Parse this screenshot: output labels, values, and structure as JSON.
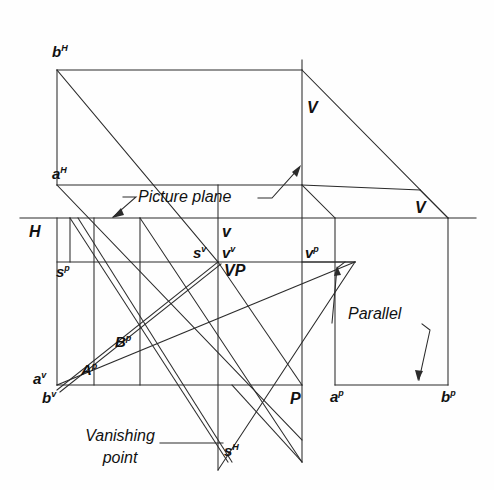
{
  "figure": {
    "type": "technical-drawing",
    "background_color": "#fefefe",
    "line_color": "#2b2b2b",
    "text_color": "#111111"
  },
  "labels": {
    "b_H": "b",
    "b_H_sup": "H",
    "a_H": "a",
    "a_H_sup": "H",
    "H": "H",
    "s_p": "s",
    "s_p_sup": "p",
    "v_small": "v",
    "s_v": "s",
    "s_v_sup": "v",
    "v_v": "v",
    "v_v_sup": "v",
    "VP": "VP",
    "v_p": "v",
    "v_p_sup": "p",
    "V_upper": "V",
    "V_right": "V",
    "V_mid": "V",
    "B_p": "B",
    "B_p_sup": "p",
    "A_p": "A",
    "A_p_sup": "p",
    "a_v": "a",
    "a_v_sup": "v",
    "b_v": "b",
    "b_v_sup": "v",
    "a_p": "a",
    "a_p_sup": "p",
    "b_p": "b",
    "b_p_sup": "p",
    "P": "P",
    "s_H": "s",
    "s_H_sup": "H"
  },
  "annotations": {
    "picture_plane": "Picture plane",
    "parallel": "Parallel",
    "vanishing_line1": "Vanishing",
    "vanishing_line2": "point"
  },
  "geometry": {
    "horizon_line_y": 218,
    "picture_plane_y": 185,
    "s_line_y": 262,
    "ground_line_y": 385,
    "left_vertical_x": 57,
    "station_vertical_x": 218,
    "principal_vertical_x": 302,
    "ap_vertical_x": 335,
    "bp_vertical_x": 448,
    "top_y": 70,
    "bottom_y": 462
  }
}
